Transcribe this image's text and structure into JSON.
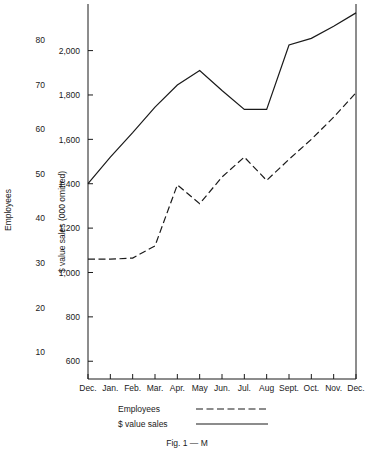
{
  "chart_data": {
    "type": "line",
    "title": "Fig. 1 — M",
    "xlabel": "",
    "ylabel": "$ value sales (000 omitted)",
    "ylabel_secondary": "Employees",
    "grid": false,
    "legend_position": "bottom-left",
    "categories": [
      "Dec.",
      "Jan.",
      "Feb.",
      "Mar.",
      "Apr.",
      "May",
      "Jun.",
      "Jul.",
      "Aug",
      "Sept.",
      "Oct.",
      "Nov.",
      "Dec."
    ],
    "y_ticks": [
      "600",
      "800",
      "1,000",
      "1,200",
      "1,400",
      "1,600",
      "1,800",
      "2,000"
    ],
    "y_tick_values": [
      600,
      800,
      1000,
      1200,
      1400,
      1600,
      1800,
      2000
    ],
    "ylim": [
      520,
      2210
    ],
    "y_ticks_secondary": [
      "10",
      "20",
      "30",
      "40",
      "50",
      "60",
      "70",
      "80"
    ],
    "y_tick_values_secondary": [
      10,
      20,
      30,
      40,
      50,
      60,
      70,
      80
    ],
    "ylim_secondary": [
      4,
      88
    ],
    "series": [
      {
        "name": "$ value sales",
        "style": "solid",
        "axis": "left",
        "values": [
          1400,
          1520,
          1630,
          1745,
          1845,
          1910,
          1820,
          1735,
          1735,
          2025,
          2055,
          2110,
          2170
        ]
      },
      {
        "name": "Employees",
        "style": "dashed",
        "axis": "left",
        "values": [
          1060,
          1060,
          1065,
          1120,
          1395,
          1310,
          1430,
          1520,
          1415,
          1510,
          1600,
          1700,
          1810
        ]
      }
    ]
  },
  "legend": {
    "items": [
      {
        "label": "Employees",
        "style": "dashed"
      },
      {
        "label": "$ value sales",
        "style": "solid"
      }
    ]
  },
  "caption": {
    "text": "Fig. 1 — M"
  },
  "axes": {
    "left_title": "Employees",
    "inner_title": "$ value sales (000 omitted)"
  }
}
